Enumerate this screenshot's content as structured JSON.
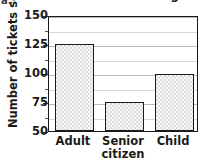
{
  "corner_label": "a.",
  "chart_data": {
    "type": "bar",
    "title": "Movie Screening",
    "xlabel": "",
    "ylabel": "Number of tickets sold",
    "categories": [
      "Adult",
      "Senior citizen",
      "Child"
    ],
    "category_lines": [
      [
        "Adult"
      ],
      [
        "Senior",
        "citizen"
      ],
      [
        "Child"
      ]
    ],
    "values": [
      125,
      75,
      99
    ],
    "ylim": [
      50,
      150
    ],
    "yticks": [
      50,
      75,
      100,
      125,
      150
    ],
    "ytick_labels": [
      "50",
      "75",
      "100",
      "125",
      "150"
    ],
    "minor_yticks": [
      62.5,
      87.5,
      112.5,
      137.5
    ],
    "grid": "horizontal",
    "legend": "none",
    "bar_fill_color": "#dcdcdc",
    "bar_edge_color": "#1a1a1a",
    "gridline_color": "#b9b9b9"
  }
}
